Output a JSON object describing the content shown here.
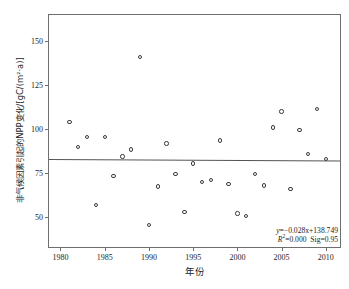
{
  "chart_data": {
    "type": "scatter",
    "title": "",
    "xlabel": "年份",
    "ylabel": "非气候因素引起的NPP变化/[gC/(m²·a)]",
    "xlim": [
      1978.7,
      1012.0
    ],
    "x_axis_min": 1978.7,
    "x_axis_max": 2011.6,
    "y_axis_min": 33.0,
    "y_axis_max": 165.0,
    "xticks": [
      1980,
      1985,
      1990,
      1995,
      2000,
      2005,
      2010
    ],
    "yticks": [
      50,
      75,
      100,
      125,
      150
    ],
    "grid": false,
    "legend": "none",
    "x": [
      1981,
      1982,
      1983,
      1984,
      1985,
      1986,
      1987,
      1988,
      1989,
      1990,
      1991,
      1992,
      1993,
      1994,
      1995,
      1996,
      1997,
      1998,
      1999,
      2000,
      2001,
      2002,
      2003,
      2004,
      2005,
      2006,
      2007,
      2008,
      2009,
      2010
    ],
    "values": [
      104,
      90,
      95.5,
      57,
      95.5,
      73.5,
      84.5,
      88.5,
      141,
      45.5,
      67.5,
      92,
      74.5,
      53,
      80.5,
      70,
      71,
      93.5,
      69,
      52,
      50.5,
      74.5,
      68,
      101,
      110,
      66,
      99.5,
      86,
      111.5,
      83
    ],
    "series_name": "非气候因素引起的NPP变化",
    "trendline": {
      "slope": -0.028,
      "intercept": 138.749,
      "y_at_xmin": 83.3,
      "y_at_xmax": 82.4
    },
    "annotations": {
      "equation_prefix": "y",
      "equation": "=−0.028x+138.749",
      "r2_prefix": "R",
      "r2_sup": "2",
      "r2_value": "=0.000",
      "sig": "Sig=0.95"
    }
  },
  "axis": {
    "x_tick_labels": [
      "1980",
      "1985",
      "1990",
      "1995",
      "2000",
      "2005",
      "2010"
    ],
    "y_tick_labels": [
      "50",
      "75",
      "100",
      "125",
      "150"
    ]
  }
}
